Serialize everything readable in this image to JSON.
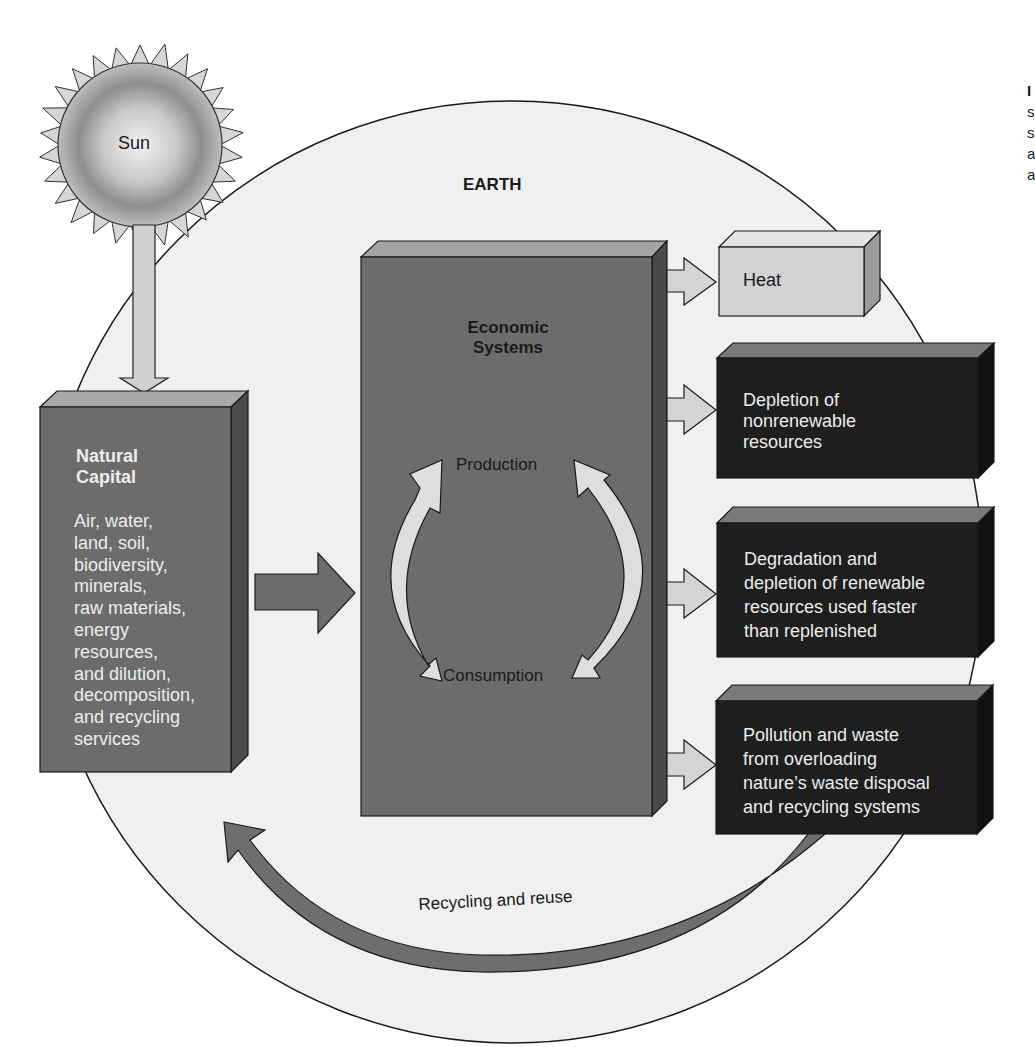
{
  "colors": {
    "background": "#ffffff",
    "earth_fill": "#f0f0f0",
    "outline": "#1a1a1a",
    "box_mid_gray": "#6c6c6c",
    "box_mid_gray_top": "#a4a4a4",
    "box_mid_gray_side": "#4a4a4a",
    "box_dark": "#1e1e1e",
    "box_dark_top": "#7a7a7a",
    "box_dark_side": "#111111",
    "heat_box": "#d2d2d2",
    "heat_top": "#e6e6e6",
    "heat_side": "#9a9a9a",
    "light_arrow": "#d4d4d4",
    "recycle_arrow": "#6e6e6e"
  },
  "sun": {
    "label": "Sun"
  },
  "earth": {
    "label": "EARTH"
  },
  "natural_capital": {
    "title_lines": [
      "Natural",
      "Capital"
    ],
    "body_lines": [
      "Air, water,",
      "land, soil,",
      "biodiversity,",
      "minerals,",
      "raw materials,",
      "energy",
      "resources,",
      "and dilution,",
      "decomposition,",
      "and recycling",
      "services"
    ]
  },
  "economic_systems": {
    "title_lines": [
      "Economic",
      "Systems"
    ],
    "cycle_top": "Production",
    "cycle_bottom": "Consumption"
  },
  "outputs": [
    {
      "id": "heat",
      "lines": [
        "Heat"
      ]
    },
    {
      "id": "depletion",
      "lines": [
        "Depletion of",
        "nonrenewable",
        "resources"
      ]
    },
    {
      "id": "degradation",
      "lines": [
        "Degradation and",
        "depletion of renewable",
        "resources used faster",
        "than replenished"
      ]
    },
    {
      "id": "pollution",
      "lines": [
        "Pollution and waste",
        "from overloading",
        "nature’s waste disposal",
        "and recycling systems"
      ]
    }
  ],
  "recycling": {
    "label": "Recycling and reuse"
  },
  "edge_fragments": [
    "I",
    "s",
    "s",
    "a",
    "a"
  ]
}
